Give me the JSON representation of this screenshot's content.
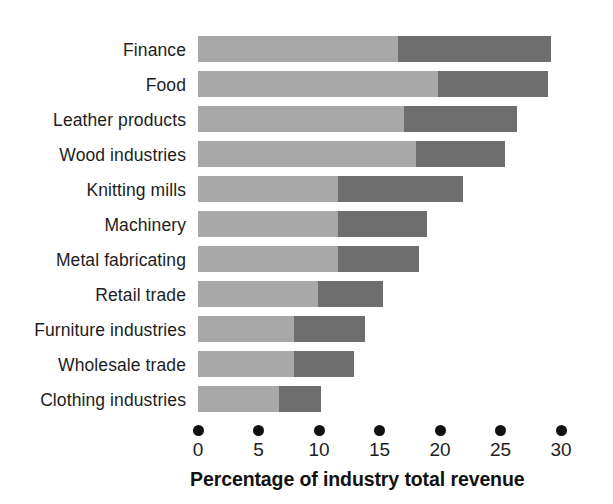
{
  "chart_data": {
    "type": "bar",
    "orientation": "horizontal",
    "stacked": true,
    "title": "",
    "xlabel": "Percentage of industry total revenue",
    "ylabel": "",
    "xlim": [
      0,
      30
    ],
    "xticks": [
      0,
      5,
      10,
      15,
      20,
      25,
      30
    ],
    "xtick_labels": [
      "0",
      "5",
      "10",
      "15",
      "20",
      "25",
      "30"
    ],
    "grid": false,
    "legend": null,
    "categories": [
      "Finance",
      "Food",
      "Leather products",
      "Wood industries",
      "Knitting mills",
      "Machinery",
      "Metal fabricating",
      "Retail trade",
      "Furniture industries",
      "Wholesale trade",
      "Clothing industries"
    ],
    "series": [
      {
        "name": "light-segment",
        "color": "#a8a8a8",
        "values": [
          16.5,
          19.8,
          17.0,
          18.0,
          11.6,
          11.6,
          11.6,
          9.9,
          7.9,
          7.9,
          6.7
        ]
      },
      {
        "name": "dark-segment",
        "color": "#6e6e6e",
        "values": [
          12.7,
          9.1,
          9.4,
          7.4,
          10.3,
          7.3,
          6.7,
          5.4,
          5.9,
          5.0,
          3.5
        ]
      }
    ],
    "totals": [
      29.2,
      28.9,
      26.4,
      25.4,
      21.9,
      18.9,
      18.3,
      15.3,
      13.8,
      12.9,
      10.2
    ],
    "colors": {
      "light": "#a8a8a8",
      "dark": "#6e6e6e",
      "tick_dot": "#111111",
      "text": "#1d1d1d",
      "background": "#ffffff"
    }
  }
}
